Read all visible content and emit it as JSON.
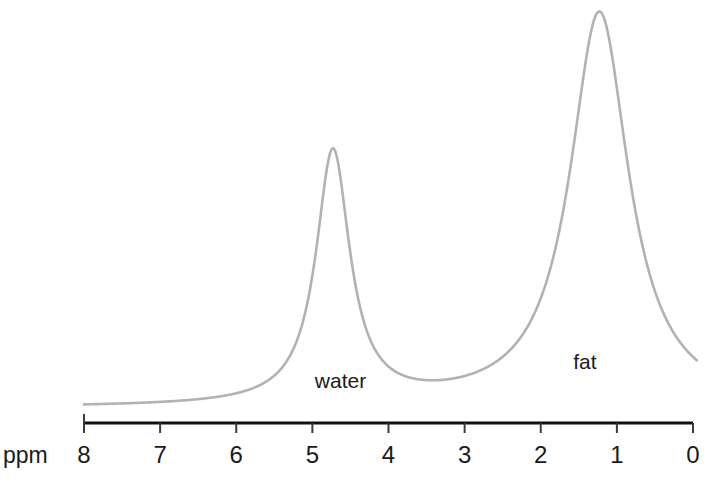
{
  "chart_data": {
    "type": "line",
    "title": "",
    "subtitle": "",
    "xlabel": "ppm",
    "ylabel": "",
    "xlim": [
      8,
      0
    ],
    "ylim": [
      0,
      1
    ],
    "grid": false,
    "legend_position": "none",
    "x_ticks": [
      "8",
      "7",
      "6",
      "5",
      "4",
      "3",
      "2",
      "1",
      "0"
    ],
    "x_tick_values": [
      8,
      7,
      6,
      5,
      4,
      3,
      2,
      1,
      0
    ],
    "axis_direction": "reversed",
    "series": [
      {
        "name": "nmr-spectrum",
        "color": "#b2b2b2",
        "line_width": 2.6,
        "peaks": [
          {
            "label": "water",
            "center_ppm": 4.73,
            "amplitude": 0.64,
            "half_width_ppm": 0.27
          },
          {
            "label": "fat",
            "center_ppm": 1.23,
            "amplitude": 1.0,
            "half_width_ppm": 0.47
          }
        ],
        "baseline": 0.0,
        "x_range": [
          8.0,
          -0.05
        ]
      }
    ],
    "annotations": [
      {
        "text": "water",
        "x_ppm": 4.63,
        "y_px": 388
      },
      {
        "text": "fat",
        "x_ppm": 1.42,
        "y_px": 369
      }
    ]
  },
  "axis": {
    "unit_label": "ppm",
    "line_color": "#111111",
    "tick_color": "#3a3a3a"
  },
  "colors": {
    "background": "#ffffff",
    "curve": "#b2b2b2",
    "text": "#1a1a1a",
    "axis": "#111111"
  }
}
